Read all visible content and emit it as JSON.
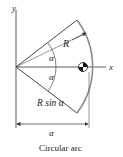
{
  "diagram": {
    "axis_x_label": "x",
    "axis_y_label": "y",
    "radius_label": "R",
    "angle_upper_label": "α",
    "angle_lower_label": "α",
    "dimension_label": "R sin α",
    "dimension_sub_label": "α",
    "caption": "Circular arc",
    "colors": {
      "line": "#333333",
      "arc": "#8a8a8a",
      "text": "#222222"
    }
  }
}
